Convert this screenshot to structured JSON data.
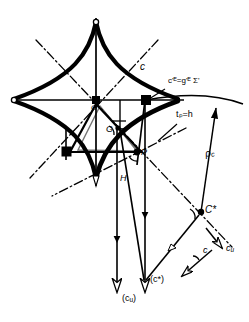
{
  "figure": {
    "kind": "geometric-construction-diagram",
    "background_color": "#ffffff",
    "ink_color": "#000000"
  },
  "labels": {
    "curve_c": "c",
    "sigma_annotation": "c'ᴱ=g'ᴱ Σ'",
    "tangent_annotation": "tₚ=h",
    "rho": "ρ",
    "rho_sub": "c",
    "point_O": "O",
    "point_G": "G",
    "point_R": "R",
    "point_P": "P",
    "point_H": "H",
    "point_Cstar": "C*",
    "vector_c_star_proj": "(c*)",
    "vector_cu_proj": "(c",
    "vector_cu_proj_sub": "u",
    "vector_cu_proj_close": ")",
    "vector_cu": "c",
    "vector_cu_sub": "u",
    "vector_c": "c"
  },
  "geometry": {
    "axis_horizontal_y": 100,
    "axis_vertical_x": 96,
    "astroid_center_x": 96,
    "astroid_center_y": 100,
    "astroid_radius_x": 82,
    "astroid_radius_y": 78,
    "point_O": [
      96,
      100
    ],
    "point_E": [
      145,
      100
    ],
    "point_G": [
      112,
      128
    ],
    "point_R": [
      118,
      128
    ],
    "point_P": [
      137,
      152
    ],
    "point_H": [
      121,
      179
    ],
    "point_C": [
      201,
      212
    ],
    "point_D": [
      66,
      161
    ],
    "tip_cu_proj": [
      117,
      296
    ],
    "tip_c_star_proj": [
      145,
      282
    ]
  }
}
